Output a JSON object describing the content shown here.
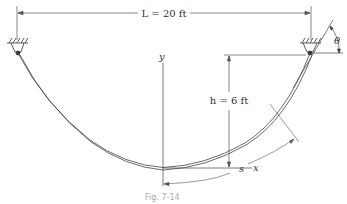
{
  "figure": {
    "caption": "Fig. 7-14",
    "span_label": "L = 20 ft",
    "sag_label": "h = 6 ft",
    "arc_length_label": "s",
    "angle_label": "θ",
    "x_axis_label": "x",
    "y_axis_label": "y"
  },
  "parameters": {
    "L": {
      "value": 20,
      "unit": "ft"
    },
    "h": {
      "value": 6,
      "unit": "ft"
    }
  },
  "colors": {
    "line": "#333333",
    "dim": "#555555",
    "caption": "#aaaaaa"
  }
}
